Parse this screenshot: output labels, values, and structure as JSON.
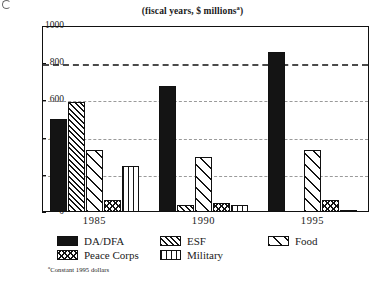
{
  "chart_data": {
    "type": "bar",
    "title": "(fiscal years, $ millions",
    "title_superscript": "a",
    "footnote_superscript": "a",
    "footnote": "Constant 1995 dollars",
    "xlabel": "",
    "ylabel": "",
    "ylim": [
      0,
      1000
    ],
    "yticks": [
      0,
      200,
      400,
      600,
      800,
      1000
    ],
    "grid": true,
    "gridlines": [
      200,
      400,
      600,
      800
    ],
    "emphasized_gridline": 800,
    "legend_position": "below",
    "categories": [
      "1985",
      "1990",
      "1995"
    ],
    "series": [
      {
        "name": "DA/DFA",
        "pattern": "solid-black",
        "values": [
          500,
          680,
          860
        ]
      },
      {
        "name": "ESF",
        "pattern": "dense-diagonal",
        "values": [
          590,
          35,
          0
        ]
      },
      {
        "name": "Food",
        "pattern": "sparse-diagonal",
        "values": [
          335,
          295,
          335
        ]
      },
      {
        "name": "Peace Corps",
        "pattern": "crosshatch",
        "values": [
          65,
          50,
          65
        ]
      },
      {
        "name": "Military",
        "pattern": "vertical-lines",
        "values": [
          245,
          40,
          10
        ]
      }
    ]
  },
  "axis": {
    "ytick_labels": [
      "1000",
      "800",
      "600",
      "400",
      "200",
      "0"
    ]
  },
  "legend": {
    "rows": [
      [
        {
          "label": "DA/DFA",
          "pattern": "solid-black"
        },
        {
          "label": "ESF",
          "pattern": "dense-diagonal"
        },
        {
          "label": "Food",
          "pattern": "sparse-diagonal"
        }
      ],
      [
        {
          "label": "Peace Corps",
          "pattern": "crosshatch"
        },
        {
          "label": "Military",
          "pattern": "vertical-lines"
        }
      ]
    ]
  },
  "colors": {
    "ink": "#141414",
    "grid": "#9a9a9a",
    "grid_bold": "#4a4a4a",
    "background": "#ffffff"
  }
}
